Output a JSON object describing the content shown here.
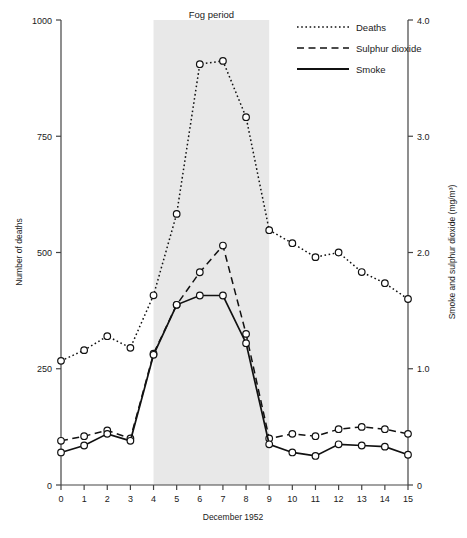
{
  "figure": {
    "band_label": "Fog period",
    "xlabel": "December 1952",
    "ylabel_left": "Number of deaths",
    "ylabel_right": "Smoke and sulphur dioxide (mg/m³)"
  },
  "legend": {
    "position": "top-right",
    "entries": [
      {
        "label": "Deaths",
        "style": "dotted",
        "marker": "open-circle"
      },
      {
        "label": "Sulphur dioxide",
        "style": "dashed",
        "marker": "open-circle"
      },
      {
        "label": "Smoke",
        "style": "solid",
        "marker": "open-circle"
      }
    ]
  },
  "axes": {
    "x_ticks": [
      "0",
      "1",
      "2",
      "3",
      "4",
      "5",
      "6",
      "7",
      "8",
      "9",
      "10",
      "11",
      "12",
      "13",
      "14",
      "15"
    ],
    "y_left_ticks": [
      "0",
      "250",
      "500",
      "750",
      "1000"
    ],
    "y_right_ticks": [
      "0",
      "1.0",
      "2.0",
      "3.0",
      "4.0"
    ]
  },
  "chart_data": {
    "type": "line",
    "title": "",
    "xlabel": "December 1952",
    "ylabel": "Number of deaths",
    "ylabel_secondary": "Smoke and sulphur dioxide (mg/m³)",
    "x": [
      0,
      1,
      2,
      3,
      4,
      5,
      6,
      7,
      8,
      9,
      10,
      11,
      12,
      13,
      14,
      15
    ],
    "xlim": [
      0,
      15
    ],
    "ylim": [
      0,
      1000
    ],
    "ylim_secondary": [
      0,
      4.0
    ],
    "grid": false,
    "legend_position": "top-right",
    "annotations": [
      {
        "text": "Fog period",
        "type": "shaded-band",
        "x_start": 4,
        "x_end": 9,
        "color": "#e8e8e8"
      }
    ],
    "series": [
      {
        "name": "Deaths",
        "axis": "left",
        "style": "dotted",
        "marker": "open-circle",
        "values": [
          267,
          290,
          320,
          295,
          408,
          583,
          905,
          912,
          791,
          548,
          520,
          490,
          500,
          458,
          434,
          400
        ]
      },
      {
        "name": "Sulphur dioxide",
        "axis": "right",
        "style": "dashed",
        "marker": "open-circle",
        "values": [
          0.38,
          0.42,
          0.47,
          0.4,
          1.13,
          1.55,
          1.83,
          2.06,
          1.3,
          0.4,
          0.44,
          0.42,
          0.48,
          0.5,
          0.48,
          0.44
        ]
      },
      {
        "name": "Smoke",
        "axis": "right",
        "style": "solid",
        "marker": "open-circle",
        "values": [
          0.28,
          0.34,
          0.44,
          0.38,
          1.12,
          1.55,
          1.63,
          1.63,
          1.22,
          0.35,
          0.28,
          0.25,
          0.35,
          0.34,
          0.33,
          0.26
        ]
      }
    ]
  }
}
